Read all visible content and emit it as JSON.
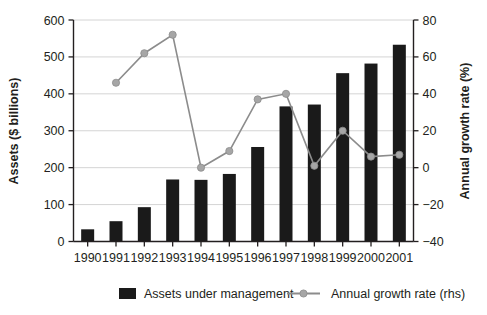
{
  "chart_data": {
    "type": "bar",
    "title": "",
    "subtitle": "",
    "xlabel": "",
    "ylabel": "Assets ($ billions)",
    "y2label": "Annual growth rate (%)",
    "categories": [
      "1990",
      "1991",
      "1992",
      "1993",
      "1994",
      "1995",
      "1996",
      "1997",
      "1998",
      "1999",
      "2000",
      "2001"
    ],
    "ylim": [
      0,
      600
    ],
    "yticks": [
      0,
      100,
      200,
      300,
      400,
      500,
      600
    ],
    "y2lim": [
      -40,
      80
    ],
    "y2ticks": [
      -40,
      -20,
      0,
      20,
      40,
      60,
      80
    ],
    "grid": true,
    "legend_position": "bottom",
    "series": [
      {
        "name": "Assets under management",
        "type": "bar",
        "axis": "left",
        "color": "#1a1a1a",
        "values": [
          33,
          55,
          93,
          168,
          167,
          183,
          256,
          366,
          371,
          456,
          482,
          533
        ]
      },
      {
        "name": "Annual growth rate (rhs)",
        "type": "line",
        "axis": "right",
        "color": "#8c8c8c",
        "values": [
          null,
          46,
          62,
          72,
          0,
          9,
          37,
          40,
          1,
          20,
          6,
          7
        ]
      }
    ]
  },
  "legend": {
    "items": [
      {
        "label": "Assets under management",
        "marker": "bar-swatch"
      },
      {
        "label": "Annual growth rate (rhs)",
        "marker": "line-dot-swatch"
      }
    ]
  }
}
